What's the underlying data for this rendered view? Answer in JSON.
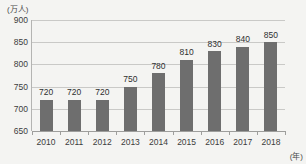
{
  "chart_data": {
    "type": "bar",
    "title": "",
    "subtitle": "",
    "categories": [
      "2010",
      "2011",
      "2012",
      "2013",
      "2014",
      "2015",
      "2016",
      "2017",
      "2018"
    ],
    "values": [
      720,
      720,
      720,
      750,
      780,
      810,
      830,
      840,
      850
    ],
    "data_labels": [
      "720",
      "720",
      "720",
      "750",
      "780",
      "810",
      "830",
      "840",
      "850"
    ],
    "xlabel": "(年)",
    "ylabel": "(万人)",
    "ylim": [
      650,
      900
    ],
    "ytick_values": [
      650,
      700,
      750,
      800,
      850,
      900
    ],
    "ytick_labels": [
      "650",
      "700",
      "750",
      "800",
      "850",
      "900"
    ],
    "grid": true,
    "legend": null,
    "legend_position": "none",
    "series_color": "#6e6e6e",
    "gridline_color": "#c9c9c7",
    "background_color": "#f4f4f2",
    "text_color": "#3c3c3c"
  }
}
